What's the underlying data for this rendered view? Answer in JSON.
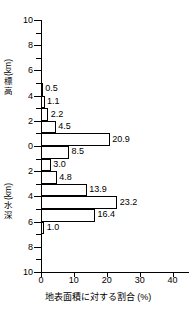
{
  "chart_data": {
    "type": "bar",
    "orientation": "horizontal",
    "title": "",
    "xlabel": "地表面積に対する割合 (%)",
    "ylabel_upper": "標高 (km)",
    "ylabel_lower": "水深 (km)",
    "xlim": [
      0,
      45
    ],
    "ylim": [
      -10,
      10
    ],
    "xticks": [
      0,
      10,
      20,
      30,
      40
    ],
    "xtick_labels": [
      "0",
      "10",
      "20",
      "30",
      "40"
    ],
    "yticks": [
      10,
      8,
      6,
      4,
      2,
      0,
      -2,
      -4,
      -6,
      -8,
      -10
    ],
    "ytick_labels": [
      "10",
      "8",
      "6",
      "4",
      "2",
      "0",
      "2",
      "4",
      "6",
      "8",
      "10"
    ],
    "yminor_ticks": [
      9,
      7,
      5,
      3,
      1,
      -1,
      -3,
      -5,
      -7,
      -9
    ],
    "grid": false,
    "legend": false,
    "bar_color": "#ffffff",
    "bar_edge_color": "#000000",
    "bands": [
      {
        "band_top": 5,
        "band_bottom": 4,
        "value": 0.5,
        "label": "0.5"
      },
      {
        "band_top": 4,
        "band_bottom": 3,
        "value": 1.1,
        "label": "1.1"
      },
      {
        "band_top": 3,
        "band_bottom": 2,
        "value": 2.2,
        "label": "2.2"
      },
      {
        "band_top": 2,
        "band_bottom": 1,
        "value": 4.5,
        "label": "4.5"
      },
      {
        "band_top": 1,
        "band_bottom": 0,
        "value": 20.9,
        "label": "20.9"
      },
      {
        "band_top": 0,
        "band_bottom": -1,
        "value": 8.5,
        "label": "8.5"
      },
      {
        "band_top": -1,
        "band_bottom": -2,
        "value": 3.0,
        "label": "3.0"
      },
      {
        "band_top": -2,
        "band_bottom": -3,
        "value": 4.8,
        "label": "4.8"
      },
      {
        "band_top": -3,
        "band_bottom": -4,
        "value": 13.9,
        "label": "13.9"
      },
      {
        "band_top": -4,
        "band_bottom": -5,
        "value": 23.2,
        "label": "23.2"
      },
      {
        "band_top": -5,
        "band_bottom": -6,
        "value": 16.4,
        "label": "16.4"
      },
      {
        "band_top": -6,
        "band_bottom": -7,
        "value": 1.0,
        "label": "1.0"
      }
    ]
  },
  "axes": {
    "x_caption": "地表面積に対する割合 (%)",
    "elevation_title_main": "標高",
    "elevation_title_unit": "(km)",
    "depth_title_main": "水深",
    "depth_title_unit": "(km)"
  }
}
